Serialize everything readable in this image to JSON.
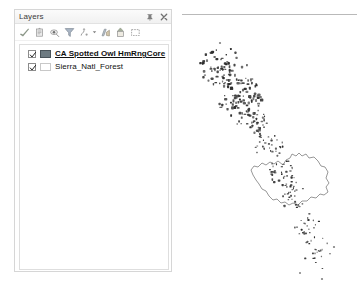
{
  "panel": {
    "title": "Layers",
    "title_buttons": [
      {
        "name": "auto-hide-pin-icon",
        "label": "Auto Hide"
      },
      {
        "name": "close-icon",
        "label": "Close"
      }
    ],
    "toolbar": [
      {
        "name": "list-by-drawing-order-icon",
        "label": "List By Drawing Order"
      },
      {
        "name": "list-by-source-icon",
        "label": "List By Source"
      },
      {
        "name": "list-by-visibility-icon",
        "label": "List By Visibility"
      },
      {
        "name": "list-by-selection-icon",
        "label": "List By Selection"
      },
      {
        "name": "options-icon",
        "label": "Options"
      },
      {
        "name": "dropdown-arrow-icon",
        "label": "More"
      },
      {
        "name": "add-data-icon",
        "label": "Add Data"
      },
      {
        "name": "move-up-icon",
        "label": "Move Up"
      },
      {
        "name": "new-group-layer-icon",
        "label": "New Group Layer"
      }
    ],
    "layers": [
      {
        "name": "CA Spotted Owl HmRngCore",
        "checked": true,
        "selected": true,
        "swatch_fill": "#6e7b82",
        "swatch_stroke": "#4a545a"
      },
      {
        "name": "Sierra_Natl_Forest",
        "checked": true,
        "selected": false,
        "swatch_fill": "#ffffff",
        "swatch_stroke": "#c8c8c8"
      }
    ]
  },
  "map": {
    "name": "map-view",
    "background": "#ffffff",
    "owl_core_color": "#2b2b2b",
    "forest_outline_color": "#7d7d7d"
  },
  "map_data": {
    "description": "Scatter of CA Spotted Owl home range core polygons along a NW-SE diagonal band, with the Sierra National Forest boundary polygon outlined near the lower middle.",
    "forest_outline": "M 101,150 L 104,145 L 108,143 L 110,139 L 114,141 L 117,138 L 120,141 L 124,139 L 127,143 L 132,142 L 136,146 L 139,151 L 143,152 L 146,157 L 144,163 L 147,168 L 144,172 L 146,177 L 142,180 L 138,179 L 134,183 L 129,182 L 125,186 L 120,186 L 116,190 L 111,188 L 107,190 L 103,187 L 99,188 L 95,184 L 91,185 L 87,181 L 84,176 L 80,174 L 77,169 L 74,165 L 71,160 L 69,155 L 72,151 L 76,152 L 80,148 L 84,150 L 88,147 L 92,149 L 96,146 Z",
    "clusters": [
      {
        "cx": 42,
        "cy": 52,
        "rx": 24,
        "ry": 20,
        "count": 70,
        "size": 2.1
      },
      {
        "cx": 58,
        "cy": 82,
        "rx": 22,
        "ry": 22,
        "count": 85,
        "size": 2.3
      },
      {
        "cx": 72,
        "cy": 108,
        "rx": 17,
        "ry": 16,
        "count": 42,
        "size": 1.9
      },
      {
        "cx": 88,
        "cy": 132,
        "rx": 15,
        "ry": 16,
        "count": 30,
        "size": 1.7
      },
      {
        "cx": 100,
        "cy": 158,
        "rx": 14,
        "ry": 14,
        "count": 34,
        "size": 1.8
      },
      {
        "cx": 110,
        "cy": 180,
        "rx": 14,
        "ry": 14,
        "count": 30,
        "size": 1.7
      },
      {
        "cx": 126,
        "cy": 214,
        "rx": 14,
        "ry": 16,
        "count": 24,
        "size": 1.6
      },
      {
        "cx": 134,
        "cy": 238,
        "rx": 14,
        "ry": 18,
        "count": 20,
        "size": 1.5
      }
    ],
    "stray_points": [
      {
        "x": 38,
        "y": 28,
        "r": 1.1
      },
      {
        "x": 22,
        "y": 46,
        "r": 1.0
      },
      {
        "x": 152,
        "y": 232,
        "r": 1.1
      },
      {
        "x": 118,
        "y": 258,
        "r": 1.0
      },
      {
        "x": 140,
        "y": 264,
        "r": 1.1
      }
    ]
  }
}
